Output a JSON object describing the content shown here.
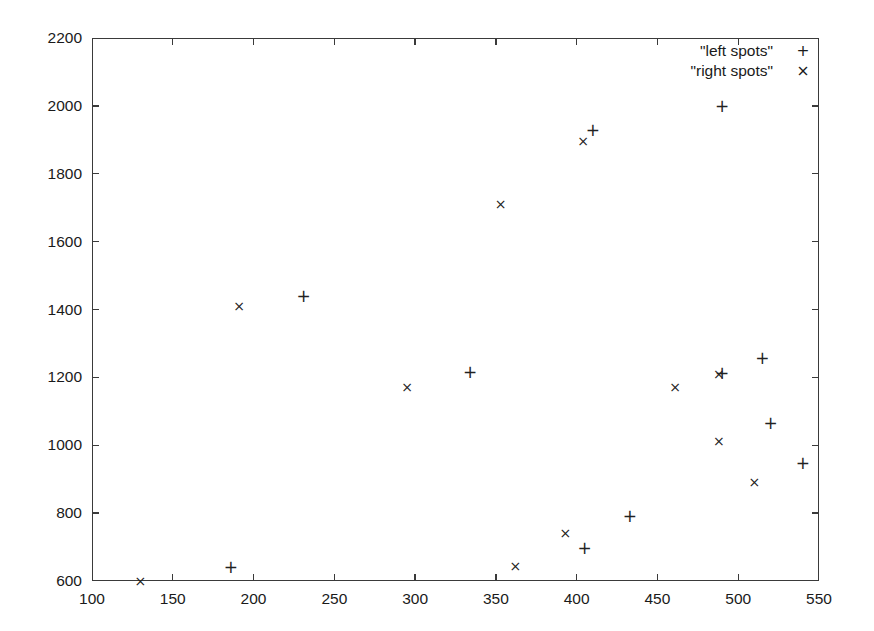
{
  "chart_data": {
    "type": "scatter",
    "title": "",
    "xlabel": "",
    "ylabel": "",
    "xlim": [
      100,
      550
    ],
    "ylim": [
      600,
      2200
    ],
    "xticks": [
      100,
      150,
      200,
      250,
      300,
      350,
      400,
      450,
      500,
      550
    ],
    "yticks": [
      600,
      800,
      1000,
      1200,
      1400,
      1600,
      1800,
      2000,
      2200
    ],
    "grid": false,
    "legend_position": "top-right",
    "series": [
      {
        "name": "\"left spots\"",
        "marker": "+",
        "points": [
          [
            186,
            641
          ],
          [
            231,
            1441
          ],
          [
            334,
            1216
          ],
          [
            405,
            698
          ],
          [
            410,
            1930
          ],
          [
            433,
            793
          ],
          [
            490,
            2000
          ],
          [
            490,
            1213
          ],
          [
            515,
            1256
          ],
          [
            520,
            1067
          ],
          [
            540,
            947
          ]
        ]
      },
      {
        "name": "\"right spots\"",
        "marker": "×",
        "points": [
          [
            130,
            601
          ],
          [
            191,
            1410
          ],
          [
            295,
            1172
          ],
          [
            353,
            1710
          ],
          [
            362,
            643
          ],
          [
            393,
            740
          ],
          [
            404,
            1897
          ],
          [
            461,
            1173
          ],
          [
            488,
            1211
          ],
          [
            488,
            1012
          ],
          [
            510,
            893
          ]
        ]
      }
    ]
  },
  "legend": {
    "entries": [
      {
        "label": "\"left spots\"",
        "marker": "+"
      },
      {
        "label": "\"right spots\"",
        "marker": "×"
      }
    ]
  },
  "axes": {
    "x_tick_labels": [
      "100",
      "150",
      "200",
      "250",
      "300",
      "350",
      "400",
      "450",
      "500",
      "550"
    ],
    "y_tick_labels": [
      "600",
      "800",
      "1000",
      "1200",
      "1400",
      "1600",
      "1800",
      "2000",
      "2200"
    ]
  },
  "colors": {
    "axis": "#3a3a3a",
    "marker": "#222222",
    "background": "#ffffff"
  }
}
